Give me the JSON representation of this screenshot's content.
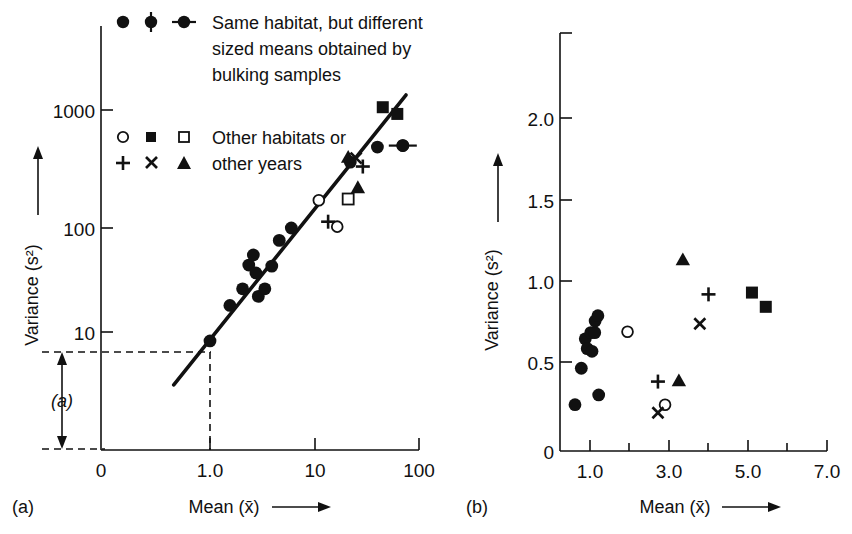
{
  "figure": {
    "background": "#ffffff",
    "ink_color": "#111111"
  },
  "panels": [
    {
      "key": "a",
      "label": "(a)",
      "xlabel": "Mean (x̄)",
      "ylabel": "Variance (s²)",
      "xlabel_arrow": "⟶",
      "ylabel_arrow": "↑",
      "annotation": "(a)",
      "xscale": "log",
      "yscale": "log",
      "xticks": [
        "0",
        "1.0",
        "10",
        "100"
      ],
      "yticks": [
        "1000",
        "100",
        "10"
      ],
      "fit_line_note": "straight fit line through points on log-log axes",
      "dashed_guides": [
        "horizontal at variance ≈ 8",
        "vertical at mean = 1.0"
      ]
    },
    {
      "key": "b",
      "label": "(b)",
      "xlabel": "Mean (x̄)",
      "ylabel": "Variance (s²)",
      "xlabel_arrow": "⟶",
      "ylabel_arrow": "↑",
      "xscale": "linear",
      "yscale": "linear",
      "xticks": [
        "1.0",
        "3.0",
        "5.0",
        "7.0"
      ],
      "yticks": [
        "0",
        "0.5",
        "1.0",
        "1.5",
        "2.0"
      ]
    }
  ],
  "legend": {
    "entries": [
      {
        "markers": [
          "filled-circle",
          "filled-circle-vertical-errorbar",
          "filled-circle-horizontal-errorbar"
        ],
        "lines": [
          "Same habitat, but different",
          "sized means obtained by",
          "bulking samples"
        ]
      },
      {
        "markers": [
          "open-circle",
          "filled-square",
          "open-square"
        ],
        "lines": [
          "Other habitats or"
        ]
      },
      {
        "markers": [
          "plus",
          "cross",
          "filled-triangle"
        ],
        "lines": [
          "other years"
        ]
      }
    ]
  },
  "chart_data": [
    {
      "id": "panel-a",
      "type": "scatter",
      "title": "",
      "xlabel": "Mean (x̄)",
      "ylabel": "Variance (s²)",
      "xscale": "log",
      "yscale": "log",
      "xlim": [
        0.3,
        130
      ],
      "ylim": [
        3.0,
        6000
      ],
      "xtick_values": [
        1,
        10,
        100
      ],
      "xtick_labels": [
        "1.0",
        "10",
        "100"
      ],
      "ytick_values": [
        10,
        100,
        1000
      ],
      "ytick_labels": [
        "10",
        "100",
        "1000"
      ],
      "grid": false,
      "legend_position": "top-left inside axes",
      "fit_line": {
        "label": "Taylor power law fit",
        "x": [
          0.45,
          75
        ],
        "y": [
          3.1,
          1900
        ]
      },
      "guides": {
        "horizontal_dashed_y": 8.0,
        "vertical_dashed_x": 1.0,
        "bracket_label": "(a)",
        "bracket_from_y": 8.0,
        "bracket_to_y": 3.0
      },
      "series": [
        {
          "name": "Same habitat, but different sized means obtained by bulking samples",
          "marker": "filled-circle",
          "points": [
            {
              "x": 1.0,
              "y": 8.2
            },
            {
              "x": 1.55,
              "y": 18.0
            },
            {
              "x": 2.05,
              "y": 26.0
            },
            {
              "x": 2.35,
              "y": 44.0
            },
            {
              "x": 2.6,
              "y": 55.0
            },
            {
              "x": 2.75,
              "y": 37.0
            },
            {
              "x": 2.9,
              "y": 22.0
            },
            {
              "x": 3.35,
              "y": 26.0
            },
            {
              "x": 3.9,
              "y": 43.0
            },
            {
              "x": 4.6,
              "y": 76.0
            },
            {
              "x": 6.0,
              "y": 100.0
            },
            {
              "x": 22.0,
              "y": 430.0
            },
            {
              "x": 40.0,
              "y": 600.0
            },
            {
              "x": 70.0,
              "y": 620.0
            }
          ]
        },
        {
          "name": "Filled circle with horizontal error bar",
          "marker": "filled-circle-horizontal-errorbar",
          "points": [
            {
              "x": 70.0,
              "y": 620.0,
              "xerr_px": 14
            }
          ]
        },
        {
          "name": "Open circles (other habitats or other years)",
          "marker": "open-circle",
          "points": [
            {
              "x": 11.0,
              "y": 185.0
            },
            {
              "x": 16.5,
              "y": 103.0
            }
          ]
        },
        {
          "name": "Filled squares (other habitats or other years)",
          "marker": "filled-square",
          "points": [
            {
              "x": 45.0,
              "y": 1450.0
            },
            {
              "x": 62.0,
              "y": 1250.0
            }
          ]
        },
        {
          "name": "Open square (other habitats or other years)",
          "marker": "open-square",
          "points": [
            {
              "x": 21.0,
              "y": 190.0
            }
          ]
        },
        {
          "name": "Plus (other years)",
          "marker": "plus",
          "points": [
            {
              "x": 13.5,
              "y": 115.0
            },
            {
              "x": 29.0,
              "y": 390.0
            }
          ]
        },
        {
          "name": "Cross (other years)",
          "marker": "cross",
          "points": [
            {
              "x": 25.0,
              "y": 470.0
            }
          ]
        },
        {
          "name": "Filled triangles (other years)",
          "marker": "filled-triangle",
          "points": [
            {
              "x": 21.0,
              "y": 480.0
            },
            {
              "x": 26.0,
              "y": 245.0
            }
          ]
        }
      ]
    },
    {
      "id": "panel-b",
      "type": "scatter",
      "title": "",
      "xlabel": "Mean (x̄)",
      "ylabel": "Variance (s²)",
      "xscale": "linear",
      "yscale": "linear",
      "xlim": [
        0.4,
        7.4
      ],
      "ylim": [
        0,
        2.45
      ],
      "xtick_values": [
        1,
        2,
        3,
        4,
        5,
        6,
        7
      ],
      "xtick_labels": [
        "1.0",
        "",
        "3.0",
        "",
        "5.0",
        "",
        "7.0"
      ],
      "ytick_values": [
        0,
        0.5,
        1.0,
        1.5,
        2.0
      ],
      "ytick_labels": [
        "0",
        "0.5",
        "1.0",
        "1.5",
        "2.0"
      ],
      "grid": false,
      "legend_position": "none",
      "series": [
        {
          "name": "Same habitat, different sized means",
          "marker": "filled-circle",
          "points": [
            {
              "x": 0.62,
              "y": 0.52
            },
            {
              "x": 0.78,
              "y": 0.93
            },
            {
              "x": 0.88,
              "y": 1.26
            },
            {
              "x": 0.93,
              "y": 1.15
            },
            {
              "x": 1.02,
              "y": 1.33
            },
            {
              "x": 1.05,
              "y": 1.12
            },
            {
              "x": 1.12,
              "y": 1.33
            },
            {
              "x": 1.13,
              "y": 1.46
            },
            {
              "x": 1.2,
              "y": 1.52
            },
            {
              "x": 1.22,
              "y": 0.63
            }
          ]
        },
        {
          "name": "Open circles",
          "marker": "open-circle",
          "points": [
            {
              "x": 1.95,
              "y": 1.34
            },
            {
              "x": 2.9,
              "y": 0.52
            }
          ]
        },
        {
          "name": "Filled squares",
          "marker": "filled-square",
          "points": [
            {
              "x": 5.1,
              "y": 1.78
            },
            {
              "x": 5.45,
              "y": 1.62
            }
          ]
        },
        {
          "name": "Plus",
          "marker": "plus",
          "points": [
            {
              "x": 2.72,
              "y": 0.78
            },
            {
              "x": 4.0,
              "y": 1.76
            }
          ]
        },
        {
          "name": "Cross",
          "marker": "cross",
          "points": [
            {
              "x": 2.72,
              "y": 0.43
            },
            {
              "x": 3.78,
              "y": 1.43
            }
          ]
        },
        {
          "name": "Filled triangles",
          "marker": "filled-triangle",
          "points": [
            {
              "x": 3.25,
              "y": 0.79
            },
            {
              "x": 3.35,
              "y": 2.15
            }
          ]
        }
      ]
    }
  ]
}
